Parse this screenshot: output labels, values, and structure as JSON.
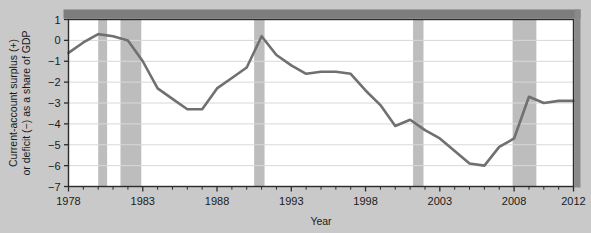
{
  "chart_data": {
    "type": "line",
    "title": "",
    "xlabel": "Year",
    "ylabel": "Current-account surplus (+) or deficit (−) as a share of GDP",
    "xlim": [
      1978,
      2012
    ],
    "ylim": [
      -7,
      1
    ],
    "xticks": [
      1978,
      1983,
      1988,
      1993,
      1998,
      2003,
      2008,
      2012
    ],
    "xtick_labels": [
      "1978",
      "1983",
      "1988",
      "1993",
      "1998",
      "2003",
      "2008",
      "2012"
    ],
    "x_minor_tick_step": 1,
    "yticks": [
      1,
      0,
      -1,
      -2,
      -3,
      -4,
      -5,
      -6,
      -7
    ],
    "ytick_labels": [
      "1",
      "0",
      "−1",
      "−2",
      "−3",
      "−4",
      "−5",
      "−6",
      "−7"
    ],
    "grid": "horizontal",
    "legend": "none",
    "line_color": "#707070",
    "grid_color": "#d8d8d8",
    "recession_band_color": "#bdbdbd",
    "plot_background": "#ffffff",
    "figure_background": "#c9c9c9",
    "x": [
      1978,
      1979,
      1980,
      1981,
      1982,
      1983,
      1984,
      1985,
      1986,
      1987,
      1988,
      1989,
      1990,
      1991,
      1992,
      1993,
      1994,
      1995,
      1996,
      1997,
      1998,
      1999,
      2000,
      2001,
      2002,
      2003,
      2004,
      2005,
      2006,
      2007,
      2008,
      2009,
      2010,
      2011,
      2012
    ],
    "values": [
      -0.6,
      -0.1,
      0.3,
      0.2,
      0.0,
      -1.0,
      -2.3,
      -2.8,
      -3.3,
      -3.3,
      -2.3,
      -1.8,
      -1.3,
      0.2,
      -0.7,
      -1.2,
      -1.6,
      -1.5,
      -1.5,
      -1.6,
      -2.4,
      -3.1,
      -4.1,
      -3.8,
      -4.3,
      -4.7,
      -5.3,
      -5.9,
      -6.0,
      -5.1,
      -4.7,
      -2.7,
      -3.0,
      -2.9,
      -2.9
    ],
    "recession_bands": [
      {
        "start": 1980.0,
        "end": 1980.6,
        "label": "1980 recession"
      },
      {
        "start": 1981.5,
        "end": 1982.9,
        "label": "1981–82 recession"
      },
      {
        "start": 1990.5,
        "end": 1991.2,
        "label": "1990–91 recession"
      },
      {
        "start": 2001.2,
        "end": 2001.9,
        "label": "2001 recession"
      },
      {
        "start": 2007.9,
        "end": 2009.5,
        "label": "2007–09 recession"
      }
    ]
  }
}
